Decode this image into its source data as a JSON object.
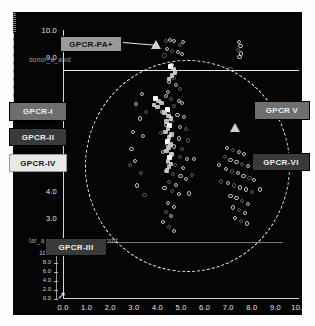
{
  "chart_data": {
    "type": "scatter",
    "title": "",
    "xlabel": "",
    "ylabel": "",
    "xlim": [
      0.0,
      10.0
    ],
    "ylim": [
      0.0,
      10.0
    ],
    "grid": false,
    "legend_position": "none",
    "x_ticks": [
      "0.0",
      "1.0",
      "2.0",
      "3.0",
      "4.0",
      "5.0",
      "6.0",
      "7.0",
      "8.0",
      "9.0",
      "10.0"
    ],
    "y_ticks": [
      "10.0",
      "9.0",
      "6.0",
      "5.0",
      "4.0",
      "3.0",
      "2.0"
    ],
    "inset_y_ticks": [
      "10.0",
      "8.0",
      "6.0",
      "4.0",
      "2.0",
      "0.0"
    ],
    "axis_caption_top": "donor_a_alvd",
    "axis_caption_bottom": "lar_a_mvdal2_1.00_H_L.bmf",
    "series": [
      {
        "name": "open-circle-markers",
        "marker": "open-circle",
        "points": [
          [
            4.35,
            9.6
          ],
          [
            4.55,
            9.62
          ],
          [
            4.72,
            9.58
          ],
          [
            4.95,
            9.45
          ],
          [
            5.1,
            9.55
          ],
          [
            4.4,
            9.3
          ],
          [
            4.62,
            9.22
          ],
          [
            4.88,
            9.18
          ],
          [
            5.05,
            9.1
          ],
          [
            4.3,
            9.05
          ],
          [
            7.45,
            9.55
          ],
          [
            7.52,
            9.4
          ],
          [
            7.4,
            9.25
          ],
          [
            7.55,
            9.12
          ],
          [
            7.48,
            9.0
          ],
          [
            7.1,
            8.55
          ],
          [
            4.6,
            8.7
          ],
          [
            4.75,
            8.45
          ],
          [
            4.68,
            8.2
          ],
          [
            4.5,
            8.05
          ],
          [
            4.8,
            7.95
          ],
          [
            4.95,
            7.8
          ],
          [
            4.45,
            7.7
          ],
          [
            4.35,
            7.55
          ],
          [
            4.58,
            7.42
          ],
          [
            4.9,
            7.35
          ],
          [
            5.05,
            7.28
          ],
          [
            4.72,
            7.15
          ],
          [
            3.35,
            7.6
          ],
          [
            3.1,
            7.25
          ],
          [
            3.5,
            6.95
          ],
          [
            3.25,
            6.7
          ],
          [
            4.2,
            6.95
          ],
          [
            4.48,
            6.88
          ],
          [
            4.85,
            6.82
          ],
          [
            5.12,
            6.75
          ],
          [
            4.62,
            6.6
          ],
          [
            4.38,
            6.45
          ],
          [
            4.95,
            6.38
          ],
          [
            5.2,
            6.3
          ],
          [
            2.95,
            6.2
          ],
          [
            3.4,
            6.05
          ],
          [
            4.15,
            6.15
          ],
          [
            4.55,
            6.05
          ],
          [
            4.9,
            5.95
          ],
          [
            5.3,
            5.88
          ],
          [
            4.4,
            5.75
          ],
          [
            4.7,
            5.65
          ],
          [
            5.05,
            5.55
          ],
          [
            4.25,
            5.45
          ],
          [
            4.6,
            5.35
          ],
          [
            4.95,
            5.25
          ],
          [
            5.25,
            5.18
          ],
          [
            4.45,
            5.05
          ],
          [
            4.75,
            4.95
          ],
          [
            5.1,
            4.85
          ],
          [
            4.35,
            4.75
          ],
          [
            4.65,
            4.62
          ],
          [
            4.98,
            4.55
          ],
          [
            5.22,
            4.45
          ],
          [
            4.5,
            4.32
          ],
          [
            4.8,
            4.22
          ],
          [
            4.3,
            4.1
          ],
          [
            4.62,
            3.98
          ],
          [
            4.92,
            3.88
          ],
          [
            3.05,
            5.1
          ],
          [
            3.3,
            4.65
          ],
          [
            3.15,
            4.2
          ],
          [
            2.9,
            5.55
          ],
          [
            3.45,
            3.85
          ],
          [
            4.45,
            3.55
          ],
          [
            4.7,
            3.4
          ],
          [
            4.35,
            3.2
          ],
          [
            4.58,
            3.05
          ],
          [
            4.25,
            2.85
          ],
          [
            4.5,
            2.65
          ],
          [
            4.72,
            2.5
          ],
          [
            6.95,
            5.6
          ],
          [
            7.2,
            5.52
          ],
          [
            7.45,
            5.45
          ],
          [
            7.68,
            5.38
          ],
          [
            6.85,
            5.25
          ],
          [
            7.1,
            5.15
          ],
          [
            7.35,
            5.08
          ],
          [
            7.6,
            5.0
          ],
          [
            7.85,
            4.92
          ],
          [
            6.9,
            4.8
          ],
          [
            7.15,
            4.72
          ],
          [
            7.4,
            4.65
          ],
          [
            7.65,
            4.55
          ],
          [
            7.9,
            4.48
          ],
          [
            8.1,
            4.4
          ],
          [
            7.0,
            4.3
          ],
          [
            7.25,
            4.2
          ],
          [
            7.5,
            4.12
          ],
          [
            7.75,
            4.05
          ],
          [
            8.0,
            3.95
          ],
          [
            7.1,
            3.82
          ],
          [
            7.35,
            3.72
          ],
          [
            7.6,
            3.62
          ],
          [
            7.85,
            3.52
          ],
          [
            7.2,
            3.38
          ],
          [
            7.45,
            3.28
          ],
          [
            7.7,
            3.18
          ],
          [
            7.3,
            3.0
          ],
          [
            7.55,
            2.88
          ],
          [
            7.8,
            2.78
          ],
          [
            6.6,
            4.95
          ],
          [
            6.7,
            4.35
          ],
          [
            8.25,
            4.85
          ],
          [
            8.35,
            4.05
          ],
          [
            5.45,
            4.6
          ],
          [
            5.55,
            5.2
          ],
          [
            5.35,
            3.9
          ],
          [
            2.85,
            4.95
          ]
        ]
      },
      {
        "name": "filled-cluster-markers",
        "marker": "filled-square",
        "points": [
          [
            4.55,
            8.65
          ],
          [
            4.68,
            8.55
          ],
          [
            4.75,
            8.42
          ],
          [
            4.62,
            8.3
          ],
          [
            4.5,
            8.18
          ],
          [
            4.42,
            7.05
          ],
          [
            4.3,
            6.92
          ],
          [
            4.48,
            6.8
          ],
          [
            4.58,
            6.7
          ],
          [
            4.38,
            6.58
          ],
          [
            4.52,
            6.45
          ],
          [
            4.45,
            6.32
          ],
          [
            4.35,
            6.2
          ],
          [
            4.6,
            6.1
          ],
          [
            4.5,
            5.98
          ],
          [
            4.42,
            5.85
          ],
          [
            4.55,
            5.72
          ],
          [
            4.48,
            5.6
          ],
          [
            4.38,
            5.48
          ],
          [
            4.6,
            5.38
          ],
          [
            4.52,
            5.25
          ],
          [
            4.45,
            5.12
          ],
          [
            4.58,
            5.0
          ],
          [
            4.5,
            4.88
          ],
          [
            4.4,
            4.75
          ],
          [
            3.92,
            7.45
          ],
          [
            4.05,
            7.35
          ],
          [
            4.18,
            7.28
          ],
          [
            3.85,
            7.2
          ],
          [
            4.0,
            7.12
          ]
        ]
      },
      {
        "name": "triangle-markers",
        "marker": "filled-triangle",
        "points": [
          [
            3.95,
            9.45
          ],
          [
            7.3,
            6.35
          ]
        ]
      }
    ],
    "annotations": [
      {
        "label": "GPCR-PA+",
        "target": [
          4.05,
          9.55
        ]
      },
      {
        "label": "GPCR-I",
        "target": [
          0.55,
          7.2
        ]
      },
      {
        "label": "GPCR-II",
        "target": [
          0.55,
          6.35
        ]
      },
      {
        "label": "GPCR-IV",
        "target": [
          0.55,
          5.6
        ]
      },
      {
        "label": "GPCR-III",
        "target": [
          1.6,
          2.2
        ]
      },
      {
        "label": "GPCR V",
        "target": [
          9.9,
          7.2
        ]
      },
      {
        "label": "GPCR-VI",
        "target": [
          9.6,
          5.45
        ]
      }
    ],
    "overlay_shape": {
      "type": "dashed-ellipse",
      "center": [
        5.1,
        5.6
      ],
      "rx": 3.6,
      "ry": 3.8
    }
  },
  "labels": {
    "pa_plus": "GPCR-PA+",
    "gpcr_1": "GPCR-I",
    "gpcr_2": "GPCR-II",
    "gpcr_4": "GPCR-IV",
    "gpcr_3": "GPCR-III",
    "gpcr_5": "GPCR V",
    "gpcr_6": "GPCR-VI"
  },
  "captions": {
    "top_left": "donor_a_alvd",
    "bottom_left": "lar_a_mvdal2_1.00_H_L.bmf"
  },
  "colors": {
    "panel_bg": "#050505",
    "axis": "#d8d8d8",
    "marker": "#cfcfcf",
    "ellipse": "#f2f2f2",
    "label_dark": "#3a3a3a",
    "label_light": "#e8e8e8"
  }
}
